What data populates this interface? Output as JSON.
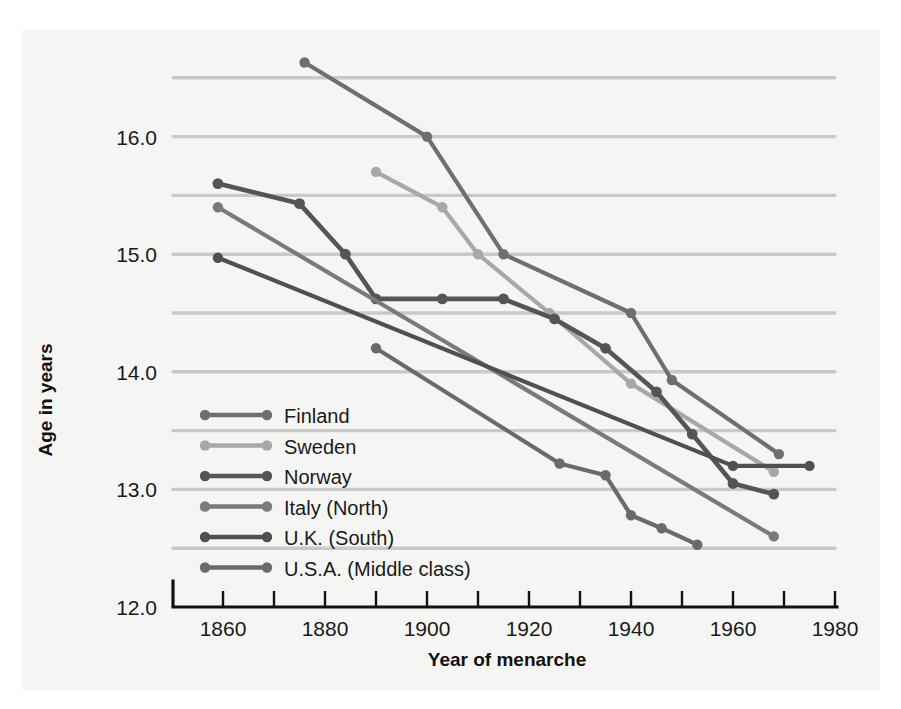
{
  "chart_data": {
    "type": "line",
    "title": "",
    "xlabel": "Year of menarche",
    "ylabel": "Age in years",
    "xlim": [
      1850,
      1980
    ],
    "ylim": [
      12.0,
      16.8
    ],
    "grid": true,
    "legend_position": "inside-left-lower",
    "x_ticks_major": [
      1860,
      1880,
      1900,
      1920,
      1940,
      1960,
      1980
    ],
    "x_ticks_minor": [
      1870,
      1890,
      1910,
      1930,
      1950,
      1970
    ],
    "x_tick_labels": [
      "1860",
      "1880",
      "1900",
      "1920",
      "1940",
      "1960",
      "1980"
    ],
    "y_ticks_major": [
      12.0,
      13.0,
      14.0,
      15.0,
      16.0
    ],
    "y_tick_labels": [
      "12.0",
      "13.0",
      "14.0",
      "15.0",
      "16.0"
    ],
    "y_gridlines": [
      12.5,
      13.0,
      13.5,
      14.0,
      14.5,
      15.0,
      15.5,
      16.0,
      16.5
    ],
    "series": [
      {
        "name": "Finland",
        "color": "#6f6f6f",
        "width": 4.2,
        "marker_size": 5.2,
        "points": [
          {
            "x": 1876,
            "y": 16.63
          },
          {
            "x": 1900,
            "y": 16.0
          },
          {
            "x": 1915,
            "y": 15.0
          },
          {
            "x": 1940,
            "y": 14.5
          },
          {
            "x": 1948,
            "y": 13.93
          },
          {
            "x": 1969,
            "y": 13.3
          }
        ]
      },
      {
        "name": "Sweden",
        "color": "#a8a8a8",
        "width": 4.2,
        "marker_size": 5.2,
        "points": [
          {
            "x": 1890,
            "y": 15.7
          },
          {
            "x": 1903,
            "y": 15.4
          },
          {
            "x": 1910,
            "y": 15.0
          },
          {
            "x": 1924,
            "y": 14.5
          },
          {
            "x": 1940,
            "y": 13.9
          },
          {
            "x": 1968,
            "y": 13.15
          }
        ]
      },
      {
        "name": "Norway",
        "color": "#555555",
        "width": 4.6,
        "marker_size": 5.4,
        "points": [
          {
            "x": 1859,
            "y": 15.6
          },
          {
            "x": 1875,
            "y": 15.43
          },
          {
            "x": 1884,
            "y": 15.0
          },
          {
            "x": 1890,
            "y": 14.62
          },
          {
            "x": 1903,
            "y": 14.62
          },
          {
            "x": 1915,
            "y": 14.62
          },
          {
            "x": 1925,
            "y": 14.45
          },
          {
            "x": 1935,
            "y": 14.2
          },
          {
            "x": 1945,
            "y": 13.83
          },
          {
            "x": 1952,
            "y": 13.47
          },
          {
            "x": 1960,
            "y": 13.05
          },
          {
            "x": 1968,
            "y": 12.96
          }
        ]
      },
      {
        "name": "Italy (North)",
        "color": "#7a7a7a",
        "width": 4.2,
        "marker_size": 5.2,
        "points": [
          {
            "x": 1859,
            "y": 15.4
          },
          {
            "x": 1968,
            "y": 12.6
          }
        ]
      },
      {
        "name": "U.K. (South)",
        "color": "#505050",
        "width": 4.2,
        "marker_size": 5.2,
        "points": [
          {
            "x": 1859,
            "y": 14.97
          },
          {
            "x": 1960,
            "y": 13.2
          },
          {
            "x": 1975,
            "y": 13.2
          }
        ]
      },
      {
        "name": "U.S.A. (Middle class)",
        "color": "#6a6a6a",
        "width": 4.2,
        "marker_size": 5.2,
        "points": [
          {
            "x": 1890,
            "y": 14.2
          },
          {
            "x": 1926,
            "y": 13.22
          },
          {
            "x": 1935,
            "y": 13.12
          },
          {
            "x": 1940,
            "y": 12.78
          },
          {
            "x": 1946,
            "y": 12.67
          },
          {
            "x": 1953,
            "y": 12.53
          }
        ]
      }
    ]
  },
  "legend": {
    "items": [
      {
        "label": "Finland",
        "color": "#6f6f6f"
      },
      {
        "label": "Sweden",
        "color": "#a8a8a8"
      },
      {
        "label": "Norway",
        "color": "#555555"
      },
      {
        "label": "Italy (North)",
        "color": "#7a7a7a"
      },
      {
        "label": "U.K. (South)",
        "color": "#505050"
      },
      {
        "label": "U.S.A. (Middle class)",
        "color": "#6a6a6a"
      }
    ]
  }
}
